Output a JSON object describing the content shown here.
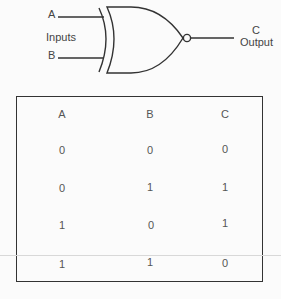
{
  "diagram": {
    "gate_type": "XNOR",
    "labels": {
      "input_a": "A",
      "inputs": "Inputs",
      "input_b": "B",
      "output_c": "C",
      "output": "Output"
    }
  },
  "truth_table": {
    "headers": [
      "A",
      "B",
      "C"
    ],
    "rows": [
      [
        "0",
        "0",
        "0"
      ],
      [
        "0",
        "1",
        "1"
      ],
      [
        "1",
        "0",
        "1"
      ],
      [
        "1",
        "1",
        "0"
      ]
    ]
  }
}
